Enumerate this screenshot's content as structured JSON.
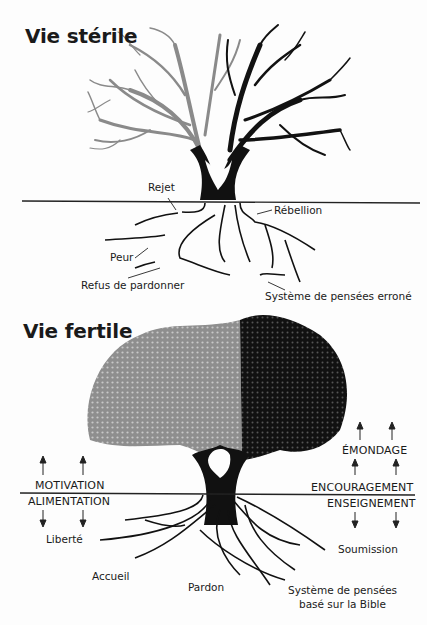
{
  "sterile": {
    "title": "Vie stérile",
    "labels": {
      "rejet": "Rejet",
      "rebellion": "Rébellion",
      "peur": "Peur",
      "refus": "Refus de pardonner",
      "systeme": "Système de pensées erroné"
    }
  },
  "fertile": {
    "title": "Vie fertile",
    "labels": {
      "motivation": "MOTIVATION",
      "alimentation": "ALIMENTATION",
      "emondage": "ÉMONDAGE",
      "encouragement": "ENCOURAGEMENT",
      "enseignement": "ENSEIGNEMENT",
      "liberte": "Liberté",
      "accueil": "Accueil",
      "pardon": "Pardon",
      "soumission": "Soumission",
      "systeme_line1": "Système de pensées",
      "systeme_line2": "basé sur la Bible"
    }
  },
  "colors": {
    "light_canopy": "#8a8a8a",
    "dark_canopy": "#141414",
    "trunk": "#111111",
    "ground_line": "#222222"
  }
}
